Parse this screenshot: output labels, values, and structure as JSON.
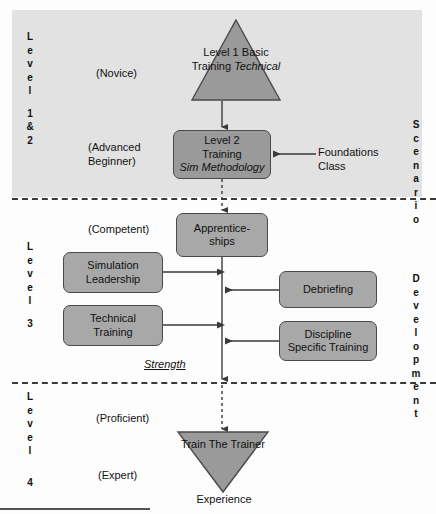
{
  "diagram": {
    "colors": {
      "band_shade": "#e2e2e2",
      "node_fill": "#a8a8a8",
      "node_fill_dark": "#9a9a9a",
      "node_stroke": "#4a4a4a",
      "connector": "#4a4a4a",
      "text": "#111111"
    }
  },
  "left_axis": {
    "groups": [
      {
        "id": "level-1-2",
        "word": "Level",
        "number": "1 & 2",
        "letters": [
          "L",
          "e",
          "v",
          "e",
          "l"
        ],
        "number_letters": [
          "1",
          "&",
          "2"
        ]
      },
      {
        "id": "level-3",
        "word": "Level",
        "number": "3",
        "letters": [
          "L",
          "e",
          "v",
          "e",
          "l"
        ],
        "number_letters": [
          "3"
        ]
      },
      {
        "id": "level-4",
        "word": "Level",
        "number": "4",
        "letters": [
          "L",
          "e",
          "v",
          "e",
          "l"
        ],
        "number_letters": [
          "4"
        ]
      }
    ]
  },
  "right_axis": {
    "groups": [
      {
        "id": "scenario",
        "word": "Scenario",
        "letters": [
          "S",
          "c",
          "e",
          "n",
          "a",
          "r",
          "i",
          "o"
        ]
      },
      {
        "id": "development",
        "word": "Development",
        "letters": [
          "D",
          "e",
          "v",
          "e",
          "l",
          "o",
          "p",
          "m",
          "e",
          "n",
          "t"
        ]
      }
    ]
  },
  "stage_labels": {
    "novice": "(Novice)",
    "advanced_beginner": "(Advanced\nBeginner)",
    "competent": "(Competent)",
    "proficient": "(Proficient)",
    "expert": "(Expert)"
  },
  "nodes": {
    "level1": {
      "shape": "triangle-up",
      "line1": "Level 1",
      "line2": "Basic",
      "line3": "Training",
      "line4_italic": "Technical"
    },
    "level2": {
      "shape": "rounded-rect",
      "line1": "Level 2",
      "line2": "Training",
      "line3_italic": "Sim Methodology"
    },
    "apprenticeships": {
      "shape": "rounded-rect",
      "line1": "Apprentice-",
      "line2": "ships"
    },
    "simulation_leadership": {
      "shape": "rounded-rect",
      "line1": "Simulation",
      "line2": "Leadership"
    },
    "technical_training": {
      "shape": "rounded-rect",
      "line1": "Technical",
      "line2": "Training"
    },
    "debriefing": {
      "shape": "rounded-rect",
      "line1": "Debriefing"
    },
    "discipline_specific_training": {
      "shape": "rounded-rect",
      "line1": "Discipline",
      "line2": "Specific Training"
    },
    "train_the_trainer": {
      "shape": "triangle-down",
      "line1": "Train",
      "line2": "The",
      "line3": "Trainer"
    }
  },
  "annotations": {
    "foundations_class": "Foundations\nClass",
    "strength": "Strength",
    "experience": "Experience"
  }
}
